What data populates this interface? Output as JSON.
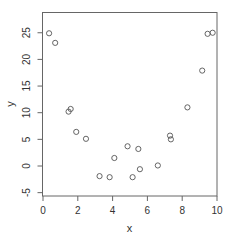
{
  "chart_data": {
    "type": "scatter",
    "title": "",
    "xlabel": "x",
    "ylabel": "y",
    "xlim": [
      0,
      10
    ],
    "ylim": [
      -5,
      28
    ],
    "x_ticks": [
      0,
      2,
      4,
      6,
      8,
      10
    ],
    "y_ticks": [
      -5,
      0,
      5,
      10,
      15,
      20,
      25
    ],
    "grid": false,
    "legend": null,
    "marker": "open-circle",
    "marker_color": "#555555",
    "points": [
      {
        "x": 0.35,
        "y": 24.9
      },
      {
        "x": 0.7,
        "y": 23.1
      },
      {
        "x": 1.47,
        "y": 10.2
      },
      {
        "x": 1.59,
        "y": 10.7
      },
      {
        "x": 1.91,
        "y": 6.4
      },
      {
        "x": 2.47,
        "y": 5.1
      },
      {
        "x": 3.25,
        "y": -1.9
      },
      {
        "x": 3.83,
        "y": -2.1
      },
      {
        "x": 4.1,
        "y": 1.5
      },
      {
        "x": 4.86,
        "y": 3.7
      },
      {
        "x": 5.15,
        "y": -2.1
      },
      {
        "x": 5.48,
        "y": 3.2
      },
      {
        "x": 5.57,
        "y": -0.6
      },
      {
        "x": 6.6,
        "y": 0.1
      },
      {
        "x": 7.3,
        "y": 5.7
      },
      {
        "x": 7.35,
        "y": 5.0
      },
      {
        "x": 8.3,
        "y": 11.0
      },
      {
        "x": 9.15,
        "y": 17.9
      },
      {
        "x": 9.46,
        "y": 24.8
      },
      {
        "x": 9.75,
        "y": 25.0
      }
    ]
  },
  "labels": {
    "x_axis_title": "x",
    "y_axis_title": "y"
  }
}
